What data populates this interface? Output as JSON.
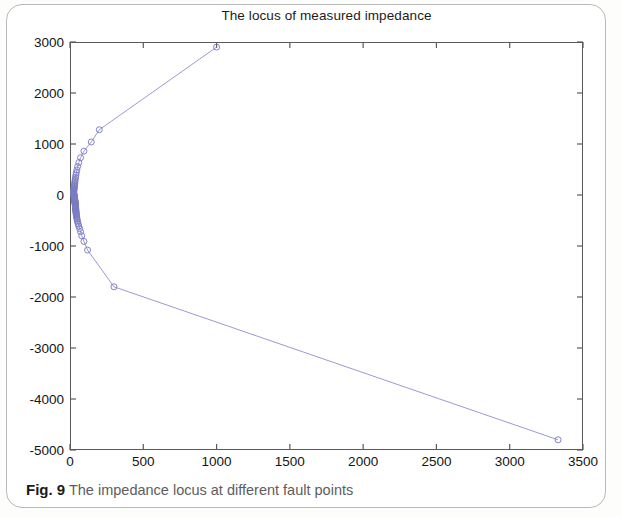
{
  "figure": {
    "caption_label": "Fig. 9",
    "caption_text": "The impedance locus at different fault points"
  },
  "chart_data": {
    "type": "scatter",
    "title": "The locus of measured impedance",
    "xlabel": "",
    "ylabel": "",
    "xlim": [
      0,
      3500
    ],
    "ylim": [
      -5000,
      3000
    ],
    "xticks": [
      0,
      500,
      1000,
      1500,
      2000,
      2500,
      3000,
      3500
    ],
    "yticks": [
      3000,
      2000,
      1000,
      0,
      -1000,
      -2000,
      -3000,
      -4000,
      -5000
    ],
    "xtick_labels": [
      "0",
      "500",
      "1000",
      "1500",
      "2000",
      "2500",
      "3000",
      "3500"
    ],
    "ytick_labels": [
      "3000",
      "2000",
      "1000",
      "0",
      "-1000",
      "-2000",
      "-3000",
      "-4000",
      "-5000"
    ],
    "grid": false,
    "legend": null,
    "marker": "circle-open",
    "marker_size": 6,
    "line_style": "solid",
    "line_color": "#8e8ecb",
    "marker_color": "#7b7bc4",
    "axis_color": "#5a5a5a",
    "series": [
      {
        "name": "Measured impedance locus",
        "x": [
          3330,
          300,
          120,
          95,
          80,
          72,
          66,
          60,
          56,
          52,
          50,
          48,
          46,
          45,
          44,
          43,
          42,
          42,
          41,
          41,
          40,
          40,
          40,
          39,
          39,
          39,
          38,
          38,
          38,
          38,
          37,
          37,
          37,
          37,
          36,
          36,
          36,
          36,
          35,
          35,
          35,
          35,
          34,
          34,
          34,
          34,
          33,
          33,
          33,
          33,
          32,
          32,
          32,
          32,
          31,
          31,
          31,
          31,
          30,
          30,
          30,
          30,
          29,
          29,
          29,
          29,
          28,
          28,
          28,
          28,
          27,
          27,
          27,
          27,
          26,
          26,
          26,
          26,
          25,
          25,
          25,
          25,
          26,
          26,
          27,
          27,
          28,
          28,
          29,
          30,
          31,
          32,
          33,
          34,
          36,
          38,
          40,
          43,
          47,
          52,
          60,
          72,
          95,
          145,
          200,
          1000
        ],
        "y": [
          -4800,
          -1800,
          -1080,
          -910,
          -800,
          -720,
          -660,
          -610,
          -570,
          -530,
          -500,
          -470,
          -445,
          -425,
          -405,
          -388,
          -372,
          -357,
          -343,
          -330,
          -318,
          -306,
          -295,
          -285,
          -275,
          -265,
          -256,
          -247,
          -239,
          -231,
          -223,
          -215,
          -208,
          -201,
          -194,
          -187,
          -181,
          -174,
          -168,
          -162,
          -156,
          -150,
          -144,
          -139,
          -133,
          -128,
          -122,
          -117,
          -112,
          -107,
          -102,
          -97,
          -92,
          -87,
          -82,
          -77,
          -72,
          -68,
          -63,
          -58,
          -54,
          -49,
          -44,
          -40,
          -35,
          -30,
          -26,
          -21,
          -16,
          -11,
          -6,
          -1,
          4,
          9,
          15,
          21,
          27,
          34,
          41,
          49,
          57,
          66,
          76,
          87,
          99,
          112,
          126,
          142,
          159,
          178,
          199,
          222,
          248,
          277,
          310,
          347,
          389,
          437,
          493,
          558,
          636,
          732,
          860,
          1040,
          1280,
          2900
        ]
      }
    ]
  }
}
